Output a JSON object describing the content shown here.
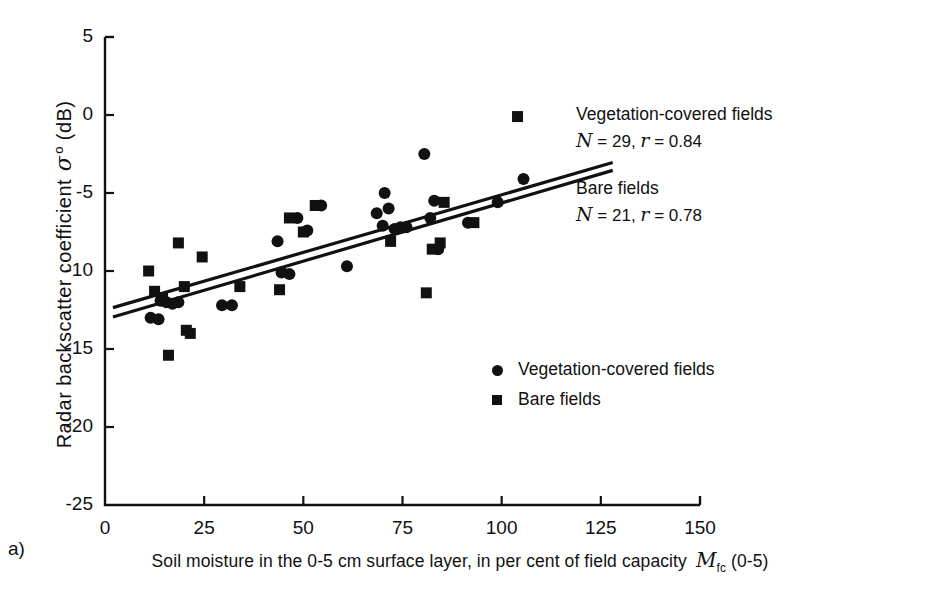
{
  "panel_label": "a)",
  "axes": {
    "y_title_prefix": "Radar backscatter coefficient ",
    "y_title_symbol": "σ",
    "y_title_sup": "o",
    "y_title_suffix": " (dB)",
    "x_title_main": "Soil moisture in the 0-5 cm surface layer, in per cent of field capacity ",
    "x_title_var": "M",
    "x_title_var_sub": "fc",
    "x_title_tail": " (0-5)"
  },
  "annotations": {
    "vegetation": {
      "title": "Vegetation-covered fields",
      "n_var": "N",
      "n_eq": " = 29, ",
      "r_var": "r",
      "r_eq": " = 0.84"
    },
    "bare": {
      "title": "Bare fields",
      "n_var": "N",
      "n_eq": " = 21, ",
      "r_var": "r",
      "r_eq": " = 0.78"
    }
  },
  "legend": {
    "position": "inside-center-right",
    "entries": [
      {
        "marker": "filled-circle",
        "label": "Vegetation-covered fields"
      },
      {
        "marker": "filled-square",
        "label": "Bare fields"
      }
    ]
  },
  "chart_data": {
    "type": "scatter",
    "title": "",
    "xlabel": "Soil moisture in the 0-5 cm surface layer, in per cent of field capacity Mfc (0-5)",
    "ylabel": "Radar backscatter coefficient σ° (dB)",
    "xlim": [
      0,
      150
    ],
    "ylim": [
      -25,
      5
    ],
    "xticks": [
      0,
      25,
      50,
      75,
      100,
      125,
      150
    ],
    "yticks": [
      5,
      0,
      -5,
      -10,
      -15,
      -20,
      -25
    ],
    "grid": false,
    "series": [
      {
        "name": "Vegetation-covered fields",
        "marker": "filled-circle",
        "color": "#111111",
        "n": 29,
        "r": 0.84,
        "points": [
          [
            11.5,
            -13.0
          ],
          [
            13.5,
            -13.1
          ],
          [
            14.0,
            -11.9
          ],
          [
            15.5,
            -12.0
          ],
          [
            17.0,
            -12.1
          ],
          [
            18.5,
            -12.0
          ],
          [
            29.5,
            -12.2
          ],
          [
            32.0,
            -12.2
          ],
          [
            43.5,
            -8.1
          ],
          [
            44.5,
            -10.1
          ],
          [
            46.5,
            -10.2
          ],
          [
            48.5,
            -6.6
          ],
          [
            51.0,
            -7.4
          ],
          [
            54.5,
            -5.8
          ],
          [
            61.0,
            -9.7
          ],
          [
            68.5,
            -6.3
          ],
          [
            70.0,
            -7.1
          ],
          [
            70.5,
            -5.0
          ],
          [
            71.5,
            -6.0
          ],
          [
            73.0,
            -7.3
          ],
          [
            74.5,
            -7.2
          ],
          [
            76.0,
            -7.2
          ],
          [
            80.5,
            -2.5
          ],
          [
            82.0,
            -6.6
          ],
          [
            83.0,
            -5.5
          ],
          [
            84.0,
            -8.6
          ],
          [
            91.5,
            -6.9
          ],
          [
            99.0,
            -5.6
          ],
          [
            105.5,
            -4.1
          ]
        ]
      },
      {
        "name": "Bare fields",
        "marker": "filled-square",
        "color": "#111111",
        "n": 21,
        "r": 0.78,
        "points": [
          [
            11.0,
            -10.0
          ],
          [
            12.5,
            -11.3
          ],
          [
            14.5,
            -11.7
          ],
          [
            16.0,
            -15.4
          ],
          [
            18.5,
            -8.2
          ],
          [
            20.0,
            -11.0
          ],
          [
            20.5,
            -13.8
          ],
          [
            21.5,
            -14.0
          ],
          [
            24.5,
            -9.1
          ],
          [
            34.0,
            -11.0
          ],
          [
            44.0,
            -11.2
          ],
          [
            46.5,
            -6.6
          ],
          [
            50.0,
            -7.5
          ],
          [
            53.0,
            -5.8
          ],
          [
            72.0,
            -8.1
          ],
          [
            81.0,
            -11.4
          ],
          [
            82.5,
            -8.6
          ],
          [
            84.5,
            -8.2
          ],
          [
            85.5,
            -5.6
          ],
          [
            93.0,
            -6.9
          ],
          [
            104.0,
            -0.1
          ]
        ]
      }
    ],
    "fit_lines": [
      {
        "name": "Vegetation-covered fields fit",
        "x": [
          2.0,
          128.0
        ],
        "y": [
          -12.35,
          -3.05
        ]
      },
      {
        "name": "Bare fields fit",
        "x": [
          2.0,
          128.0
        ],
        "y": [
          -12.95,
          -3.55
        ]
      }
    ]
  }
}
